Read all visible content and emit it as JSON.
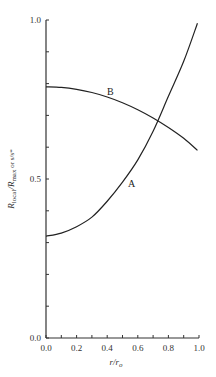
{
  "chart_data": {
    "type": "line",
    "title": "",
    "xlabel": "r/r_o",
    "ylabel": "R_local/R_max or s/s*",
    "xlim": [
      0.0,
      1.0
    ],
    "ylim": [
      0.0,
      1.0
    ],
    "grid": false,
    "legend": "inline labels",
    "x_ticks": [
      "0.0",
      "0.2",
      "0.4",
      "0.6",
      "0.8",
      "1.0"
    ],
    "y_ticks": [
      "0.0",
      "0.5",
      "1.0"
    ],
    "series": [
      {
        "name": "A",
        "x": [
          0.0,
          0.1,
          0.2,
          0.3,
          0.4,
          0.5,
          0.6,
          0.7,
          0.8,
          0.9,
          0.99
        ],
        "values": [
          0.32,
          0.33,
          0.35,
          0.38,
          0.43,
          0.49,
          0.56,
          0.65,
          0.76,
          0.87,
          0.99
        ]
      },
      {
        "name": "B",
        "x": [
          0.0,
          0.1,
          0.2,
          0.3,
          0.4,
          0.5,
          0.6,
          0.7,
          0.8,
          0.9,
          0.99
        ],
        "values": [
          0.79,
          0.788,
          0.782,
          0.772,
          0.758,
          0.74,
          0.718,
          0.692,
          0.662,
          0.628,
          0.59
        ]
      }
    ]
  },
  "labels": {
    "curve_a": "A",
    "curve_b": "B",
    "xlabel": "r/r",
    "xlabel_sub": "o",
    "ylabel_r1": "R",
    "ylabel_local": "local",
    "ylabel_slash": "/",
    "ylabel_r2": "R",
    "ylabel_max": "max",
    "ylabel_or": " or s/s*"
  }
}
